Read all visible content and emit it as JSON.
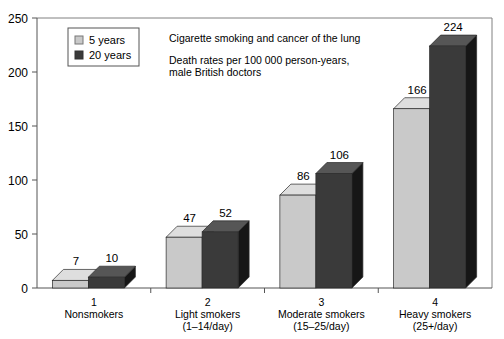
{
  "chart_data": {
    "type": "bar",
    "title": "Cigarette smoking and cancer of the lung",
    "subtitle_line1": "Death rates per 100 000 person-years,",
    "subtitle_line2": "male British doctors",
    "xlabel": "",
    "ylabel": "",
    "ylim": [
      0,
      250
    ],
    "yticks": [
      0,
      50,
      100,
      150,
      200,
      250
    ],
    "ytick_labels": [
      "0",
      "50",
      "100",
      "150",
      "200",
      "250"
    ],
    "grid": false,
    "legend_position": "top-left",
    "style": "3d-grouped-bar",
    "categories": [
      "1\nNonsmokers",
      "2\nLight smokers\n(1–14/day)",
      "3\nModerate smokers\n(15–25/day)",
      "4\nHeavy smokers\n(25+/day)"
    ],
    "category_lines": [
      [
        "1",
        "Nonsmokers",
        ""
      ],
      [
        "2",
        "Light smokers",
        "(1–14/day)"
      ],
      [
        "3",
        "Moderate smokers",
        "(15–25/day)"
      ],
      [
        "4",
        "Heavy smokers",
        "(25+/day)"
      ]
    ],
    "series": [
      {
        "name": "5 years",
        "color": "#c9c9c9",
        "top_color": "#dedede",
        "side_color": "#a8a8a8",
        "values": [
          7,
          47,
          86,
          166
        ],
        "labels": [
          "7",
          "47",
          "86",
          "166"
        ]
      },
      {
        "name": "20 years",
        "color": "#3a3a3a",
        "top_color": "#565656",
        "side_color": "#161616",
        "values": [
          10,
          52,
          106,
          224
        ],
        "labels": [
          "10",
          "52",
          "106",
          "224"
        ]
      }
    ]
  },
  "legend": {
    "items": [
      {
        "label": "5 years",
        "swatch": "#c9c9c9"
      },
      {
        "label": "20 years",
        "swatch": "#3a3a3a"
      }
    ]
  },
  "annotations": {
    "title": "Cigarette smoking and cancer of the lung",
    "subtitle_line1": "Death rates per 100 000 person-years,",
    "subtitle_line2": "male British doctors"
  }
}
